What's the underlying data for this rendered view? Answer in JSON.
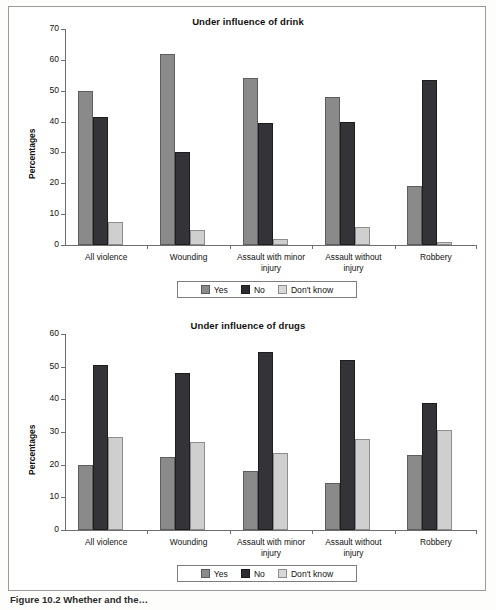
{
  "figure": {
    "caption": "Figure 10.2  Whether and the… ",
    "y_axis_label": "Percentages"
  },
  "legend": {
    "items": [
      {
        "key": "yes",
        "label": "Yes",
        "color": "#8a8a8a"
      },
      {
        "key": "no",
        "label": "No",
        "color": "#2b2b30"
      },
      {
        "key": "dk",
        "label": "Don't know",
        "color": "#d8d8d8"
      }
    ]
  },
  "chart_data": [
    {
      "type": "bar",
      "title": "Under influence of drink",
      "xlabel": "",
      "ylabel": "Percentages",
      "ylim": [
        0,
        70
      ],
      "yticks": [
        0,
        10,
        20,
        30,
        40,
        50,
        60,
        70
      ],
      "grid": false,
      "legend_position": "bottom",
      "categories": [
        "All violence",
        "Wounding",
        "Assault with minor\ninjury",
        "Assault without\ninjury",
        "Robbery"
      ],
      "series": [
        {
          "name": "Yes",
          "color": "#8a8a8a",
          "values": [
            50,
            62,
            54,
            48,
            19
          ]
        },
        {
          "name": "No",
          "color": "#2b2b30",
          "values": [
            41.5,
            30,
            39.5,
            40,
            53.5
          ]
        },
        {
          "name": "Don't know",
          "color": "#d8d8d8",
          "values": [
            7.5,
            5,
            2,
            6,
            1
          ]
        }
      ]
    },
    {
      "type": "bar",
      "title": "Under influence of drugs",
      "xlabel": "",
      "ylabel": "Percentages",
      "ylim": [
        0,
        60
      ],
      "yticks": [
        0,
        10,
        20,
        30,
        40,
        50,
        60
      ],
      "grid": false,
      "legend_position": "bottom",
      "categories": [
        "All violence",
        "Wounding",
        "Assault with minor\ninjury",
        "Assault without\ninjury",
        "Robbery"
      ],
      "series": [
        {
          "name": "Yes",
          "color": "#8a8a8a",
          "values": [
            20,
            22.5,
            18,
            14.5,
            23
          ]
        },
        {
          "name": "No",
          "color": "#2b2b30",
          "values": [
            50.5,
            48,
            54.5,
            52,
            39
          ]
        },
        {
          "name": "Don't know",
          "color": "#d8d8d8",
          "values": [
            28.5,
            27,
            23.5,
            28,
            30.5
          ]
        }
      ]
    }
  ]
}
